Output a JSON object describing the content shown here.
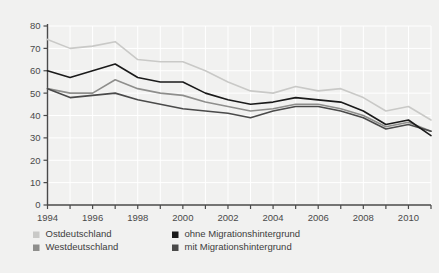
{
  "chart_data": {
    "type": "line",
    "title": "",
    "subtitle": "",
    "xlabel": "",
    "ylabel": "",
    "xlim": [
      1994,
      2011
    ],
    "ylim": [
      0,
      80
    ],
    "grid": true,
    "legend_position": "bottom",
    "x": [
      1994,
      1995,
      1996,
      1997,
      1998,
      1999,
      2000,
      2001,
      2002,
      2003,
      2004,
      2005,
      2006,
      2007,
      2008,
      2009,
      2010,
      2011
    ],
    "x_tick_labels": [
      "1994",
      "1996",
      "1998",
      "2000",
      "2002",
      "2004",
      "2006",
      "2008",
      "2010"
    ],
    "x_tick_values": [
      1994,
      1996,
      1998,
      2000,
      2002,
      2004,
      2006,
      2008,
      2010
    ],
    "y_tick_labels": [
      "0",
      "10",
      "20",
      "30",
      "40",
      "50",
      "60",
      "70",
      "80"
    ],
    "y_tick_values": [
      0,
      10,
      20,
      30,
      40,
      50,
      60,
      70,
      80
    ],
    "series": [
      {
        "name": "Ostdeutschland",
        "color": "#c9c9c7",
        "values": [
          74,
          70,
          71,
          73,
          65,
          64,
          64,
          60,
          55,
          51,
          50,
          53,
          51,
          52,
          48,
          42,
          44,
          38
        ]
      },
      {
        "name": "Westdeutschland",
        "color": "#8e8e8c",
        "values": [
          52,
          50,
          50,
          56,
          52,
          50,
          49,
          46,
          44,
          42,
          43,
          45,
          45,
          43,
          40,
          35,
          37,
          33
        ]
      },
      {
        "name": "ohne Migrationshintergrund",
        "color": "#1a1a1a",
        "values": [
          60,
          57,
          60,
          63,
          57,
          55,
          55,
          50,
          47,
          45,
          46,
          48,
          47,
          46,
          42,
          36,
          38,
          31
        ]
      },
      {
        "name": "mit Migrationshintergrund",
        "color": "#4a4a4a",
        "values": [
          52,
          48,
          49,
          50,
          47,
          45,
          43,
          42,
          41,
          39,
          42,
          44,
          44,
          42,
          39,
          34,
          36,
          33
        ]
      }
    ]
  },
  "legend": {
    "items": [
      {
        "label": "Ostdeutschland",
        "color": "#c9c9c7"
      },
      {
        "label": "ohne Migrationshintergrund",
        "color": "#1a1a1a"
      },
      {
        "label": "Westdeutschland",
        "color": "#8e8e8c"
      },
      {
        "label": "mit Migrationshintergrund",
        "color": "#4a4a4a"
      }
    ]
  },
  "style": {
    "background": "#f1f1f0",
    "grid_color": "#ffffff",
    "axis_color": "#4a4a4a"
  }
}
